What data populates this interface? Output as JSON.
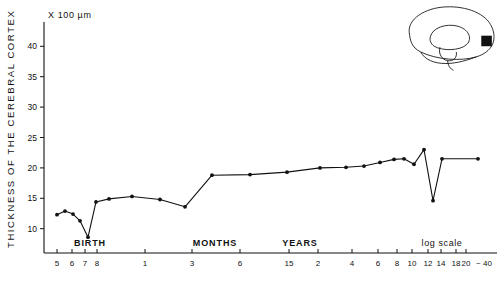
{
  "figure": {
    "unit_label": "X 100 µm",
    "y_axis_title": "THICKNESS OF THE CEREBRAL CORTEX",
    "scale_note": "log scale",
    "approx_label": "~ 40",
    "era_labels": [
      "BIRTH",
      "MONTHS",
      "YEARS"
    ],
    "brain_icon_name": "sagittal-brain-diagram",
    "brain_marker_name": "occipital-cortex-marker"
  },
  "chart_data": {
    "type": "line",
    "title": "",
    "subtitle": "",
    "xlabel": "",
    "ylabel": "THICKNESS OF THE CEREBRAL CORTEX",
    "y_unit": "X 100 µm",
    "xscale": "log",
    "grid": false,
    "legend": "none",
    "ylim": [
      6,
      44
    ],
    "yticks": [
      10,
      15,
      20,
      25,
      30,
      35,
      40
    ],
    "ytick_labels": [
      "10",
      "15",
      "20",
      "25",
      "30",
      "35",
      "40"
    ],
    "x_axis_note": "log scale",
    "era_bands": [
      {
        "label": "BIRTH",
        "x_px": 90
      },
      {
        "label": "MONTHS",
        "x_px": 215
      },
      {
        "label": "YEARS",
        "x_px": 300
      }
    ],
    "xticks": [
      {
        "label": "5",
        "x_px": 57,
        "unit": "fetal month"
      },
      {
        "label": "6",
        "x_px": 72,
        "unit": "fetal month"
      },
      {
        "label": "7",
        "x_px": 85,
        "unit": "fetal month"
      },
      {
        "label": "8",
        "x_px": 97,
        "unit": "fetal month"
      },
      {
        "label": "1",
        "x_px": 145,
        "unit": "month"
      },
      {
        "label": "3",
        "x_px": 192,
        "unit": "month"
      },
      {
        "label": "6",
        "x_px": 240,
        "unit": "month"
      },
      {
        "label": "15",
        "x_px": 289,
        "unit": "month"
      },
      {
        "label": "2",
        "x_px": 318,
        "unit": "year"
      },
      {
        "label": "4",
        "x_px": 352,
        "unit": "year"
      },
      {
        "label": "6",
        "x_px": 378,
        "unit": "year"
      },
      {
        "label": "8",
        "x_px": 397,
        "unit": "year"
      },
      {
        "label": "10",
        "x_px": 412,
        "unit": "year"
      },
      {
        "label": "12",
        "x_px": 428,
        "unit": "year"
      },
      {
        "label": "14",
        "x_px": 441,
        "unit": "year"
      },
      {
        "label": "18",
        "x_px": 456,
        "unit": "year"
      },
      {
        "label": "20",
        "x_px": 466,
        "unit": "year"
      },
      {
        "label": "~ 40",
        "x_px": 484,
        "unit": "year"
      }
    ],
    "points": [
      {
        "x_px": 57,
        "value": 12.3
      },
      {
        "x_px": 65,
        "value": 12.9
      },
      {
        "x_px": 73,
        "value": 12.4
      },
      {
        "x_px": 80,
        "value": 11.3
      },
      {
        "x_px": 88,
        "value": 8.6
      },
      {
        "x_px": 96,
        "value": 14.4
      },
      {
        "x_px": 109,
        "value": 14.9
      },
      {
        "x_px": 132,
        "value": 15.3
      },
      {
        "x_px": 160,
        "value": 14.8
      },
      {
        "x_px": 185,
        "value": 13.6
      },
      {
        "x_px": 212,
        "value": 18.8
      },
      {
        "x_px": 250,
        "value": 18.9
      },
      {
        "x_px": 287,
        "value": 19.3
      },
      {
        "x_px": 320,
        "value": 20.0
      },
      {
        "x_px": 346,
        "value": 20.1
      },
      {
        "x_px": 364,
        "value": 20.3
      },
      {
        "x_px": 380,
        "value": 20.9
      },
      {
        "x_px": 394,
        "value": 21.4
      },
      {
        "x_px": 404,
        "value": 21.5
      },
      {
        "x_px": 414,
        "value": 20.6
      },
      {
        "x_px": 424,
        "value": 23.0
      },
      {
        "x_px": 433,
        "value": 14.6
      },
      {
        "x_px": 442,
        "value": 21.5
      },
      {
        "x_px": 478,
        "value": 21.5
      }
    ],
    "annotations": [
      "Sharp prenatal-to-birth decline to a minimum near term",
      "Rapid postnatal increase then long plateau",
      "Single sharp dip near 14-18 years"
    ]
  }
}
